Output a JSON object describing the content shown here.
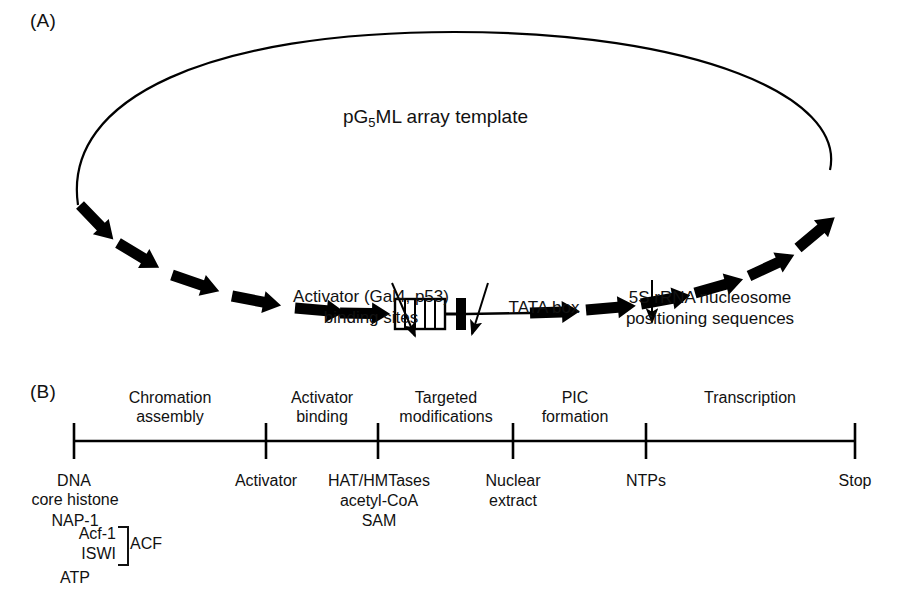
{
  "figure": {
    "panel_a_label": "(A)",
    "panel_b_label": "(B)"
  },
  "panel_a": {
    "template_title_prefix": "pG",
    "template_title_subscript": "5",
    "template_title_suffix": "ML array template",
    "annotations": {
      "activator_sites": "Activator (Gal4, p53)\nbinding sites",
      "tata_box": "TATA box",
      "rrna_positioning": "5S rRNA nucleosome\npositioning sequences"
    },
    "elements": {
      "gal4_site_count": 5,
      "nucleosome_arrow_count_left": 6,
      "nucleosome_arrow_count_right": 6,
      "circle_color": "#000000",
      "arrow_color": "#000000"
    }
  },
  "panel_b": {
    "stages": [
      {
        "label": "Chromation\nassembly"
      },
      {
        "label": "Activator\nbinding"
      },
      {
        "label": "Targeted\nmodifications"
      },
      {
        "label": "PIC\nformation"
      },
      {
        "label": "Transcription"
      }
    ],
    "timepoints": [
      {
        "label": "DNA"
      },
      {
        "label": "Activator"
      },
      {
        "label": "HAT/HMTases\nacetyl-CoA\nSAM"
      },
      {
        "label": "Nuclear\nextract"
      },
      {
        "label": "NTPs"
      },
      {
        "label": "Stop"
      }
    ],
    "reagents_dna": {
      "core_histone": "core histone",
      "nap1": "NAP-1",
      "acf1": "Acf-1",
      "iswi": "ISWI",
      "acf_complex": "ACF",
      "atp": "ATP"
    },
    "axis_color": "#000000"
  }
}
